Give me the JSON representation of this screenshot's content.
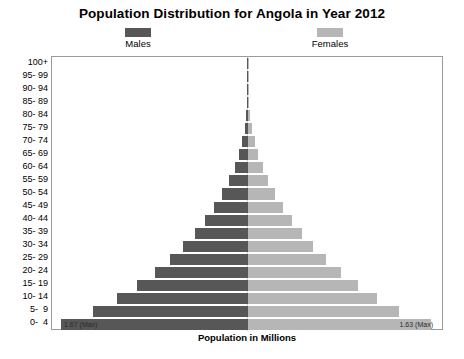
{
  "title": "Population Distribution for Angola in Year 2012",
  "legend": {
    "males": {
      "label": "Males",
      "color": "#575757"
    },
    "females": {
      "label": "Females",
      "color": "#b6b6b6"
    }
  },
  "xlabel": "Population in Millions",
  "annotations": {
    "male_max": "1.67 (Max)",
    "female_max": "1.63 (Max)"
  },
  "chart_data": {
    "type": "bar",
    "title": "Population Distribution for Angola in Year 2012",
    "xlabel": "Population in Millions",
    "ylabel": "",
    "orientation": "horizontal",
    "layout": "population-pyramid",
    "grid": false,
    "legend_position": "top",
    "categories": [
      "0-  4",
      "5-  9",
      "10- 14",
      "15- 19",
      "20- 24",
      "25- 29",
      "30- 34",
      "35- 39",
      "40- 44",
      "45- 49",
      "50- 54",
      "55- 59",
      "60- 64",
      "65- 69",
      "70- 74",
      "75- 79",
      "80- 84",
      "85- 89",
      "90- 94",
      "95- 99",
      "100+"
    ],
    "series": [
      {
        "name": "Males",
        "values": [
          1.67,
          1.38,
          1.17,
          0.99,
          0.83,
          0.7,
          0.58,
          0.47,
          0.38,
          0.3,
          0.23,
          0.17,
          0.12,
          0.08,
          0.05,
          0.03,
          0.016,
          0.006,
          0.002,
          0.0005,
          0.0001
        ]
      },
      {
        "name": "Females",
        "values": [
          1.63,
          1.35,
          1.15,
          0.98,
          0.83,
          0.7,
          0.58,
          0.48,
          0.39,
          0.31,
          0.24,
          0.18,
          0.13,
          0.09,
          0.06,
          0.035,
          0.018,
          0.007,
          0.002,
          0.0005,
          0.0001
        ]
      }
    ],
    "max_male": 1.67,
    "max_female": 1.63,
    "xlim": [
      1.75,
      1.75
    ]
  }
}
